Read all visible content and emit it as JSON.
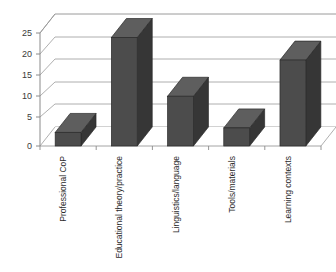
{
  "chart_data": {
    "type": "bar",
    "title": "",
    "subtitle": "",
    "xlabel": "",
    "ylabel": "",
    "categories": [
      "Professional CoP",
      "Educational theory/practice",
      "Linguistics/language",
      "Tools/materials",
      "Learning contexts"
    ],
    "values": [
      3,
      24,
      11,
      4,
      19
    ],
    "ylim": [
      0,
      25
    ],
    "yticks": [
      0,
      5,
      10,
      15,
      20,
      25
    ],
    "ytick_labels": [
      "0",
      "5",
      "10",
      "15",
      "20",
      "25"
    ],
    "grid": true,
    "legend": "none",
    "style": "3d-column",
    "colors": {
      "bar_front": "#4c4c4c",
      "bar_side": "#363636",
      "bar_top": "#5e5e5e",
      "bar_outline": "#2a2a2a",
      "gridline": "#9a9a9a",
      "axis": "#8a8a8a",
      "text": "#2b2b2b",
      "background": "#ffffff"
    }
  }
}
